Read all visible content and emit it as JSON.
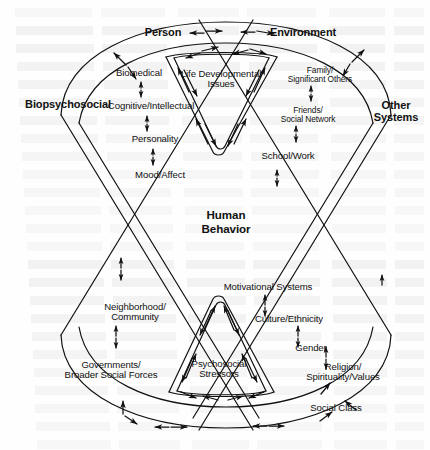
{
  "figure": {
    "center_label": "Human\nBehavior",
    "quadrant_headings": [
      {
        "id": "person",
        "text": "Person",
        "x": 163,
        "y": 33
      },
      {
        "id": "environment",
        "text": "Environment",
        "x": 303,
        "y": 33
      },
      {
        "id": "biopsychosocial",
        "text": "Biopsychosocial",
        "x": 68,
        "y": 105
      },
      {
        "id": "other-systems",
        "text": "Other\nSystems",
        "x": 396,
        "y": 112
      }
    ],
    "center": {
      "text": "Human\nBehavior",
      "x": 226,
      "y": 222
    },
    "person_factors": [
      {
        "id": "biomedical",
        "text": "Biomedical",
        "x": 139,
        "y": 73
      },
      {
        "id": "cognitive-intellectual",
        "text": "Cognitive/Intellectual",
        "x": 151,
        "y": 106
      },
      {
        "id": "personality",
        "text": "Personality",
        "x": 155,
        "y": 139
      },
      {
        "id": "mood-affect",
        "text": "Mood/Affect",
        "x": 160,
        "y": 175
      }
    ],
    "environment_factors": [
      {
        "id": "family-significant-others",
        "text": "Family/\nSignificant Others",
        "x": 320,
        "y": 75
      },
      {
        "id": "friends-social-network",
        "text": "Friends/\nSocial Network",
        "x": 308,
        "y": 115
      },
      {
        "id": "school-work",
        "text": "School/Work",
        "x": 288,
        "y": 156
      }
    ],
    "biopsychosocial_factors": [
      {
        "id": "neighborhood-community",
        "text": "Neighborhood/\nCommunity",
        "x": 135,
        "y": 312
      },
      {
        "id": "governments-broader-social-forces",
        "text": "Governments/\nBroader Social Forces",
        "x": 111,
        "y": 370
      }
    ],
    "other_systems_factors": [
      {
        "id": "motivational-systems",
        "text": "Motivational Systems",
        "x": 268,
        "y": 287
      },
      {
        "id": "culture-ethnicity",
        "text": "Culture/Ethnicity",
        "x": 289,
        "y": 319
      },
      {
        "id": "gender",
        "text": "Gender",
        "x": 311,
        "y": 348
      },
      {
        "id": "religion-spirituality-values",
        "text": "Religion/\nSpirituality/Values",
        "x": 343,
        "y": 372
      },
      {
        "id": "social-class",
        "text": "Social Class",
        "x": 336,
        "y": 408
      }
    ],
    "inner_cone_labels": [
      {
        "id": "life-developmental-issues",
        "text": "Life Developmental\nIssues",
        "x": 221,
        "y": 79
      },
      {
        "id": "psychosocial-stressors",
        "text": "Psychosocial\nStressors",
        "x": 219,
        "y": 369
      }
    ],
    "colors": {
      "ink": "#111111",
      "paper": "#fefefe",
      "bleed": "#888888"
    },
    "stroke_width": 1.2,
    "arrow_count": 34
  }
}
